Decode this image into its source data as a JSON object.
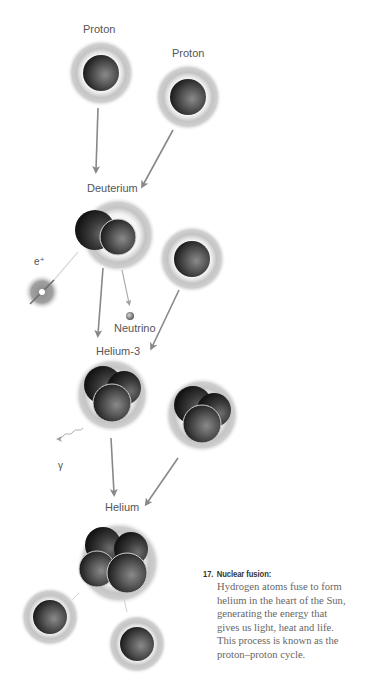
{
  "diagram": {
    "stages": [
      {
        "id": "proton-1",
        "label": "Proton"
      },
      {
        "id": "proton-2",
        "label": "Proton"
      },
      {
        "id": "deuterium",
        "label": "Deuterium"
      },
      {
        "id": "helium-3",
        "label": "Helium-3"
      },
      {
        "id": "helium",
        "label": "Helium"
      }
    ],
    "byproducts": {
      "positron": "e⁺",
      "neutrino": "Neutrino",
      "gamma": "γ"
    },
    "colors": {
      "arrow": "#888888",
      "halo": "#c8c8c8",
      "core_dark": "#2a2a2a",
      "core_mid": "#6a6a6a",
      "label": "#555555"
    }
  },
  "caption": {
    "number": "17.",
    "title": "Nuclear fusion:",
    "lines": [
      "Hydrogen atoms fuse to form",
      "helium in the heart of the Sun,",
      "generating the energy that",
      "gives us light, heat and life.",
      "This process is known as the",
      "proton–proton cycle."
    ]
  }
}
